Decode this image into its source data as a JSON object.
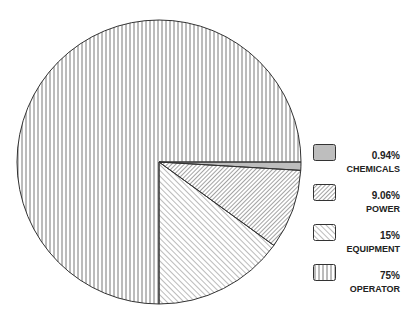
{
  "chart_data": {
    "type": "pie",
    "title": "",
    "categories": [
      "CHEMICALS",
      "POWER",
      "EQUIPMENT",
      "OPERATOR"
    ],
    "values": [
      0.94,
      9.06,
      15,
      75
    ],
    "labels": [
      "0.94%",
      "9.06%",
      "15%",
      "75%"
    ],
    "patterns": [
      "dense-vertical",
      "dense-diagonal-backslash",
      "diagonal-slash",
      "vertical"
    ],
    "legend_position": "right",
    "start_angle_deg": 0,
    "direction": "clockwise-from-3-oclock"
  },
  "legend": [
    {
      "pct": "0.94%",
      "label": "CHEMICALS"
    },
    {
      "pct": "9.06%",
      "label": "POWER"
    },
    {
      "pct": "15%",
      "label": "EQUIPMENT"
    },
    {
      "pct": "75%",
      "label": "OPERATOR"
    }
  ]
}
